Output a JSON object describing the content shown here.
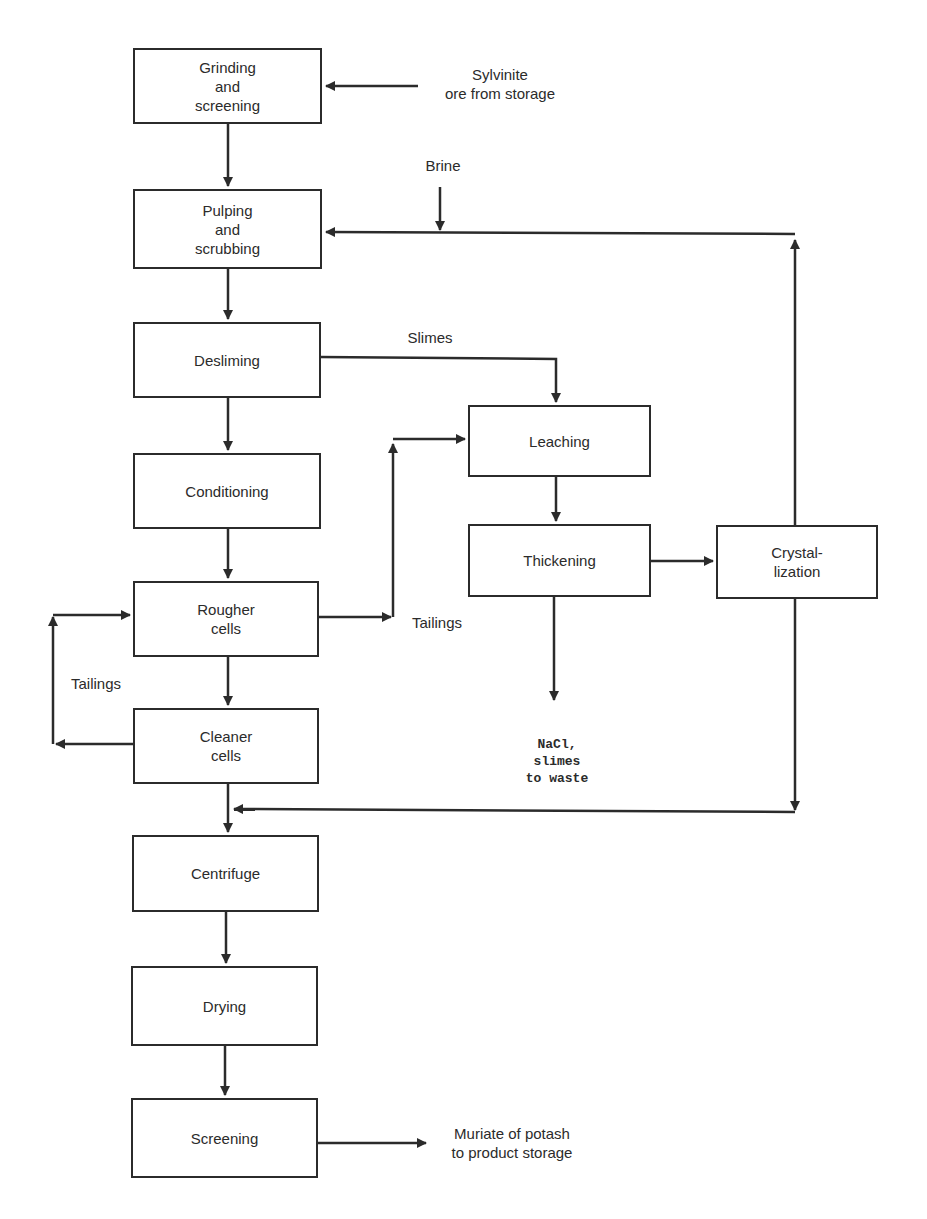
{
  "diagram": {
    "type": "process-flow",
    "colors": {
      "line": "#2b2b2b",
      "background": "#ffffff"
    },
    "boxes": [
      {
        "id": "grinding",
        "label": "Grinding\nand\nscreening"
      },
      {
        "id": "pulping",
        "label": "Pulping\nand\nscrubbing"
      },
      {
        "id": "desliming",
        "label": "Desliming"
      },
      {
        "id": "conditioning",
        "label": "Conditioning"
      },
      {
        "id": "rougher",
        "label": "Rougher\ncells"
      },
      {
        "id": "cleaner",
        "label": "Cleaner\ncells"
      },
      {
        "id": "centrifuge",
        "label": "Centrifuge"
      },
      {
        "id": "drying",
        "label": "Drying"
      },
      {
        "id": "screening",
        "label": "Screening"
      },
      {
        "id": "leaching",
        "label": "Leaching"
      },
      {
        "id": "thickening",
        "label": "Thickening"
      },
      {
        "id": "crystalization",
        "label": "Crystal-\nlization"
      }
    ],
    "labels": {
      "sylvinite": "Sylvinite\nore from storage",
      "brine": "Brine",
      "slimes": "Slimes",
      "tailings_rougher": "Tailings",
      "tailings_cleaner": "Tailings",
      "waste": "NaCl,\nslimes\nto waste",
      "product": "Muriate of potash\nto product storage"
    },
    "edges": [
      {
        "from": "sylvinite",
        "to": "grinding"
      },
      {
        "from": "grinding",
        "to": "pulping"
      },
      {
        "from": "brine",
        "to": "pulping"
      },
      {
        "from": "crystalization",
        "to": "pulping",
        "label": "recycle"
      },
      {
        "from": "pulping",
        "to": "desliming"
      },
      {
        "from": "desliming",
        "to": "leaching",
        "label": "Slimes"
      },
      {
        "from": "desliming",
        "to": "conditioning"
      },
      {
        "from": "conditioning",
        "to": "rougher"
      },
      {
        "from": "rougher",
        "to": "leaching",
        "label": "Tailings"
      },
      {
        "from": "rougher",
        "to": "cleaner"
      },
      {
        "from": "cleaner",
        "to": "rougher",
        "label": "Tailings"
      },
      {
        "from": "leaching",
        "to": "thickening"
      },
      {
        "from": "thickening",
        "to": "crystalization"
      },
      {
        "from": "thickening",
        "to": "waste"
      },
      {
        "from": "crystalization",
        "to": "centrifuge"
      },
      {
        "from": "cleaner",
        "to": "centrifuge"
      },
      {
        "from": "centrifuge",
        "to": "drying"
      },
      {
        "from": "drying",
        "to": "screening"
      },
      {
        "from": "screening",
        "to": "product"
      }
    ]
  }
}
